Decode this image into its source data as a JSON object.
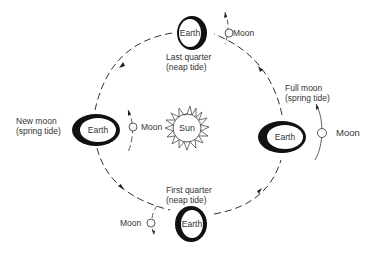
{
  "diagram": {
    "type": "moon-phases-tides",
    "center": {
      "label": "Sun"
    },
    "orbit": {
      "style": "dashed",
      "direction": "counterclockwise"
    },
    "positions": [
      {
        "id": "last-quarter",
        "earth_label": "Earth",
        "phase": "Last quarter",
        "tide": "(neap tide)",
        "moon_label": "Moon"
      },
      {
        "id": "full-moon",
        "earth_label": "Earth",
        "phase": "Full moon",
        "tide": "(spring tide)",
        "moon_label": "Moon"
      },
      {
        "id": "first-quarter",
        "earth_label": "Earth",
        "phase": "First quarter",
        "tide": "(neap tide)",
        "moon_label": "Moon"
      },
      {
        "id": "new-moon",
        "earth_label": "Earth",
        "phase": "New moon",
        "tide": "(spring tide)",
        "moon_label": "Moon"
      }
    ]
  }
}
